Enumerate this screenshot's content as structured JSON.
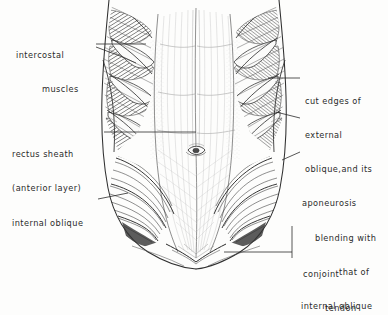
{
  "figure": {
    "style": "pen-and-ink anatomical line drawing",
    "background_color": "#fdfdfc",
    "ink_color": "#2b2b2b"
  },
  "labels": {
    "intercostal": {
      "line1": "intercostal",
      "line2": "muscles"
    },
    "rectus_sheath": {
      "line1": "rectus sheath",
      "line2": "(anterior layer)"
    },
    "internal_oblique": {
      "line1": "internal oblique"
    },
    "cut_edges": {
      "line1": "cut edges of",
      "line2": "external",
      "line3": "oblique,and its",
      "line4": "aponeurosis",
      "line5": "blending with",
      "line6": "that of",
      "line7": "internal oblique"
    },
    "conjoint_tendon": {
      "line1": "conjoint",
      "line2": "tendon"
    }
  }
}
